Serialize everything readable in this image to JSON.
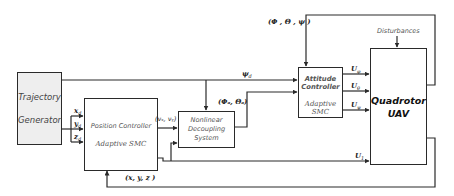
{
  "diagram": {
    "blocks": {
      "trajectory_generator": {
        "line1": "Trajectory",
        "line2": "Generator"
      },
      "position_controller": {
        "title": "Position Controller",
        "subtitle": "Adaptive SMC"
      },
      "nonlinear_decoupling": {
        "line1": "Nonlinear",
        "line2": "Decoupling",
        "line3": "System"
      },
      "attitude_controller": {
        "title": "Attitude Controller",
        "subtitle": "Adaptive SMC"
      },
      "quadrotor": {
        "line1": "Quadrotor",
        "line2": "UAV"
      }
    },
    "signals": {
      "x_d": "x",
      "x_d_sub": "d",
      "y_d": "y",
      "y_d_sub": "d",
      "z_d": "z",
      "z_d_sub": "d",
      "virtual_inputs": "(vₓ, vᵧ)",
      "psi_d": "ψ",
      "psi_d_sub": "d",
      "phi_theta_d": "(Φₐ, Θₐ)",
      "attitude_feedback": "(Φ , Θ , ψ )",
      "position_feedback": "(x, y, z )",
      "u_phi": "U",
      "u_phi_sub": "φ",
      "u_theta": "U",
      "u_theta_sub": "θ",
      "u_psi": "U",
      "u_psi_sub": "ψ",
      "u_1": "U",
      "u_1_sub": "1",
      "disturbances": "Disturbances"
    },
    "colors": {
      "line": "#2a2a2a",
      "block_fill": "#ffffff",
      "generator_fill": "#eeeeee"
    }
  }
}
